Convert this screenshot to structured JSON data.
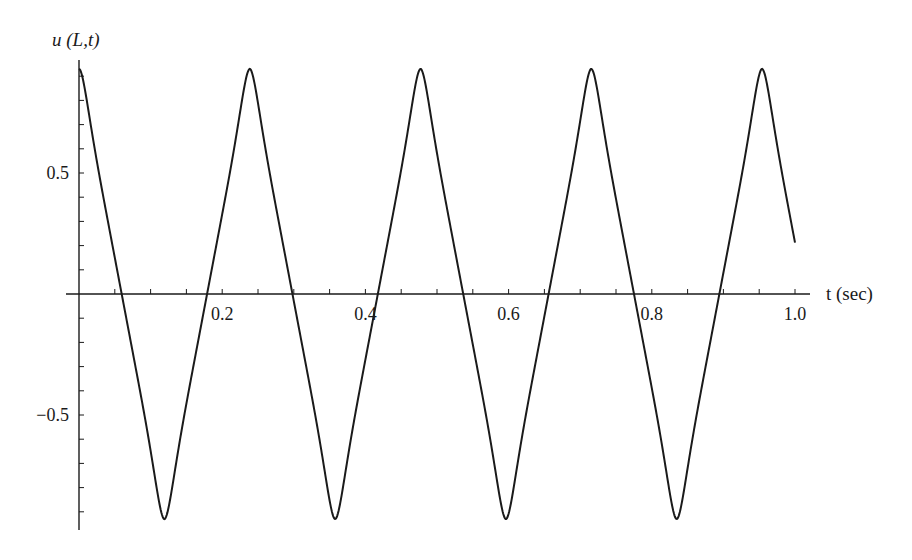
{
  "chart_data": {
    "type": "line",
    "title": "",
    "xlabel": "t (sec)",
    "ylabel": "u (L,t)",
    "xlim": [
      0,
      1.0
    ],
    "ylim": [
      -0.93,
      0.93
    ],
    "x_ticks": [
      0.2,
      0.4,
      0.6,
      0.8,
      1.0
    ],
    "x_tick_labels": [
      "0.2",
      "0.4",
      "0.6",
      "0.8",
      "1.0"
    ],
    "y_ticks": [
      -0.5,
      0.5
    ],
    "y_tick_labels": [
      "−0.5",
      "0.5"
    ],
    "x_minor_step": 0.05,
    "y_minor_step": 0.1,
    "grid": false,
    "legend": null,
    "series": [
      {
        "name": "u(L,t)",
        "shape": "near-triangular periodic wave with rounded peaks",
        "amplitude": 0.93,
        "period": 0.2385,
        "x": [
          0,
          0.0596,
          0.119,
          0.179,
          0.237,
          0.297,
          0.357,
          0.416,
          0.475,
          0.535,
          0.594,
          0.654,
          0.713,
          0.773,
          0.833,
          0.892,
          0.955,
          1.0
        ],
        "y": [
          0.93,
          0,
          -0.93,
          0,
          0.93,
          0,
          -0.93,
          0,
          0.93,
          0,
          -0.93,
          0,
          0.93,
          0,
          -0.93,
          0,
          0.93,
          0.2
        ]
      }
    ]
  }
}
